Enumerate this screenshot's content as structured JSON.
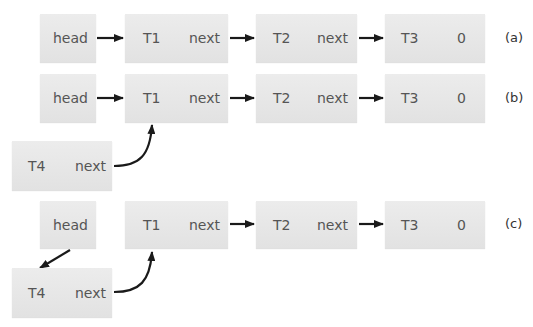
{
  "rows": [
    {
      "label": "(a)",
      "head": "head",
      "nodes": [
        {
          "name": "T1",
          "ptr": "next"
        },
        {
          "name": "T2",
          "ptr": "next"
        },
        {
          "name": "T3",
          "ptr": "0"
        }
      ]
    },
    {
      "label": "(b)",
      "head": "head",
      "nodes": [
        {
          "name": "T1",
          "ptr": "next"
        },
        {
          "name": "T2",
          "ptr": "next"
        },
        {
          "name": "T3",
          "ptr": "0"
        }
      ],
      "new_node": {
        "name": "T4",
        "ptr": "next"
      }
    },
    {
      "label": "(c)",
      "head": "head",
      "nodes": [
        {
          "name": "T1",
          "ptr": "next"
        },
        {
          "name": "T2",
          "ptr": "next"
        },
        {
          "name": "T3",
          "ptr": "0"
        }
      ],
      "new_node": {
        "name": "T4",
        "ptr": "next"
      }
    }
  ],
  "colors": {
    "box": "#e6e6e6",
    "text": "#555555",
    "arrow": "#1a1a1a"
  }
}
